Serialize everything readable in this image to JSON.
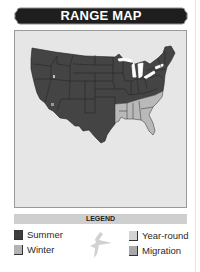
{
  "header": {
    "title": "RANGE MAP"
  },
  "map": {
    "region": "contiguous-united-states",
    "fill_colors": {
      "summer": "#444444",
      "winter": "#b9b9b9",
      "background": "#e6e6e6",
      "lakes": "#ffffff"
    }
  },
  "legend": {
    "title": "LEGEND",
    "items": [
      {
        "label": "Summer",
        "color": "#3d3d3d"
      },
      {
        "label": "Winter",
        "color": "#b3b3b3"
      },
      {
        "label": "Year-round",
        "color": "#d4d4d4"
      },
      {
        "label": "Migration",
        "color": "#a8a8a8"
      }
    ],
    "icon": "bird-silhouette-icon"
  }
}
